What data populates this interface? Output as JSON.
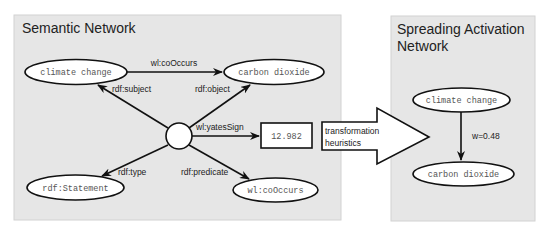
{
  "semantic_network": {
    "title": "Semantic Network",
    "nodes": {
      "climate_change": "climate change",
      "carbon_dioxide": "carbon dioxide",
      "statement": "rdf:Statement",
      "cooccurs": "wl:coOccurs",
      "value": "12.982"
    },
    "edges": {
      "cooccurs": "wl:coOccurs",
      "subject": "rdf:subject",
      "object": "rdf:object",
      "yates_sign": "wl:yatesSign",
      "type": "rdf:type",
      "predicate": "rdf:predicate"
    }
  },
  "transformation": {
    "line1": "transformation",
    "line2": "heuristics"
  },
  "spreading_activation_network": {
    "title_line1": "Spreading Activation",
    "title_line2": "Network",
    "nodes": {
      "climate_change": "climate change",
      "carbon_dioxide": "carbon dioxide"
    },
    "edge_weight": "w=0.48"
  },
  "colors": {
    "panel_bg": "#e6e6e6",
    "panel_border": "#cfcfcf",
    "stroke": "#111111",
    "node_fill": "#ffffff"
  }
}
